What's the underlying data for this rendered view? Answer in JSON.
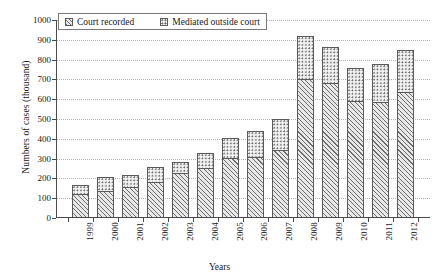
{
  "chart_data": {
    "type": "bar",
    "subtype": "stacked-vertical",
    "title": "",
    "xlabel": "Years",
    "ylabel": "Numbers of cases (thousand)",
    "categories": [
      "1999",
      "2000",
      "2001",
      "2002",
      "2003",
      "2004",
      "2005",
      "2006",
      "2007",
      "2008",
      "2009",
      "2010",
      "2011",
      "2012"
    ],
    "series": [
      {
        "name": "Court recorded",
        "pattern": "diagonal-hatch",
        "values": [
          120,
          135,
          155,
          180,
          225,
          255,
          305,
          310,
          345,
          700,
          680,
          590,
          585,
          635
        ]
      },
      {
        "name": "Mediated outside court",
        "pattern": "dotted",
        "values": [
          48,
          70,
          60,
          80,
          58,
          73,
          99,
          132,
          155,
          220,
          185,
          170,
          192,
          212
        ]
      }
    ],
    "totals": [
      168,
      205,
      215,
      260,
      283,
      328,
      404,
      442,
      500,
      920,
      865,
      760,
      777,
      847
    ],
    "ylim": [
      0,
      1000
    ],
    "y_ticks": [
      "0",
      "100",
      "200",
      "300",
      "400",
      "500",
      "600",
      "700",
      "800",
      "900",
      "1000"
    ],
    "y_tick_values": [
      0,
      100,
      200,
      300,
      400,
      500,
      600,
      700,
      800,
      900,
      1000
    ],
    "grid": "horizontal-dotted",
    "legend_position": "top-left-inside"
  },
  "legend": {
    "entries": [
      {
        "label": "Court recorded",
        "swatch": "hatch-swatch-icon"
      },
      {
        "label": "Mediated outside court",
        "swatch": "dot-swatch-icon"
      }
    ]
  },
  "axes": {
    "x_title": "Years",
    "y_title": "Numbers of cases (thousand)"
  }
}
